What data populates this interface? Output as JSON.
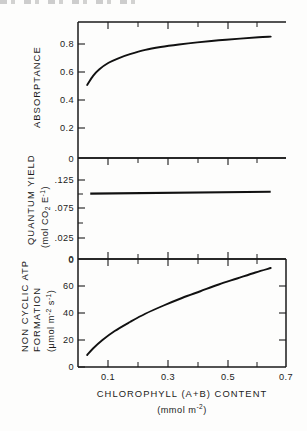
{
  "figure": {
    "background_color": "#fdfdfc",
    "ink_color": "#1b1b1b",
    "panel_count": 3
  },
  "xaxis": {
    "label_line1": "CHLOROPHYLL (A+B) CONTENT",
    "label_line2_prefix": "(mmol m",
    "label_line2_sup": "-2",
    "label_line2_suffix": ")",
    "ticks_major": [
      "0.1",
      "0.3",
      "0.5",
      "0.7"
    ],
    "ticks_major_values": [
      0.1,
      0.3,
      0.5,
      0.7
    ],
    "ticks_minor_values": [
      0.2,
      0.4,
      0.6
    ],
    "range": [
      0.04,
      0.72
    ]
  },
  "panels": {
    "top": {
      "name": "absorptance-panel",
      "ylabel": "ABSORPTANCE",
      "ticks": [
        "0.8",
        "0.6",
        "0.4",
        "0.2"
      ],
      "tick_values": [
        0.8,
        0.6,
        0.4,
        0.2
      ],
      "ylim": [
        0.0,
        0.95
      ]
    },
    "middle": {
      "name": "quantum-yield-panel",
      "ylabel_line1": "QUANTUM YIELD",
      "ylabel_line2_prefix": "(mol CO",
      "ylabel_line2_sub": "2",
      "ylabel_line2_mid": " E",
      "ylabel_line2_sup": "-1",
      "ylabel_line2_suffix": ")",
      "ticks": [
        "0",
        ".125",
        ".075",
        ".025",
        "0"
      ],
      "tick_fracs": [
        0.0,
        0.22,
        0.5,
        0.78,
        1.0
      ],
      "ylim": [
        0.0,
        0.16
      ]
    },
    "bottom": {
      "name": "atp-formation-panel",
      "ylabel_line1": "NON CYCLIC ATP",
      "ylabel_line2": "FORMATION",
      "ylabel_line3_prefix": "(",
      "ylabel_line3_mu": "μ",
      "ylabel_line3_mid": "mol m",
      "ylabel_line3_sup1": "-2",
      "ylabel_line3_mid2": " s",
      "ylabel_line3_sup2": "-1",
      "ylabel_line3_suffix": ")",
      "ticks": [
        "60",
        "40",
        "20",
        "0"
      ],
      "tick_values": [
        60,
        40,
        20,
        0
      ],
      "ylim": [
        0,
        72
      ]
    }
  },
  "chart_data": [
    {
      "type": "line",
      "title": "Absorptance vs chlorophyll content",
      "xlabel": "CHLOROPHYLL (A+B) CONTENT (mmol m-2)",
      "ylabel": "ABSORPTANCE",
      "xlim": [
        0.04,
        0.72
      ],
      "ylim": [
        0.0,
        0.95
      ],
      "grid": false,
      "legend": "none",
      "x": [
        0.07,
        0.09,
        0.11,
        0.14,
        0.17,
        0.21,
        0.26,
        0.31,
        0.37,
        0.43,
        0.5,
        0.57,
        0.63,
        0.67
      ],
      "values": [
        0.51,
        0.575,
        0.62,
        0.665,
        0.695,
        0.725,
        0.755,
        0.775,
        0.793,
        0.808,
        0.822,
        0.834,
        0.843,
        0.848
      ]
    },
    {
      "type": "line",
      "title": "Quantum yield vs chlorophyll content",
      "xlabel": "CHLOROPHYLL (A+B) CONTENT (mmol m-2)",
      "ylabel": "QUANTUM YIELD (mol CO2 E-1)",
      "xlim": [
        0.04,
        0.72
      ],
      "ylim": [
        0.0,
        0.16
      ],
      "grid": false,
      "legend": "none",
      "x": [
        0.08,
        0.67
      ],
      "values": [
        0.1035,
        0.1065
      ]
    },
    {
      "type": "line",
      "title": "Non cyclic ATP formation vs chlorophyll content",
      "xlabel": "CHLOROPHYLL (A+B) CONTENT (mmol m-2)",
      "ylabel": "NON CYCLIC ATP FORMATION (umol m-2 s-1)",
      "xlim": [
        0.04,
        0.72
      ],
      "ylim": [
        0,
        72
      ],
      "grid": false,
      "legend": "none",
      "x": [
        0.07,
        0.09,
        0.12,
        0.16,
        0.21,
        0.26,
        0.32,
        0.38,
        0.44,
        0.5,
        0.56,
        0.62,
        0.67
      ],
      "values": [
        8.0,
        12.5,
        18.0,
        24.0,
        30.0,
        35.5,
        41.0,
        46.0,
        50.5,
        55.0,
        59.0,
        63.0,
        66.0
      ]
    }
  ]
}
